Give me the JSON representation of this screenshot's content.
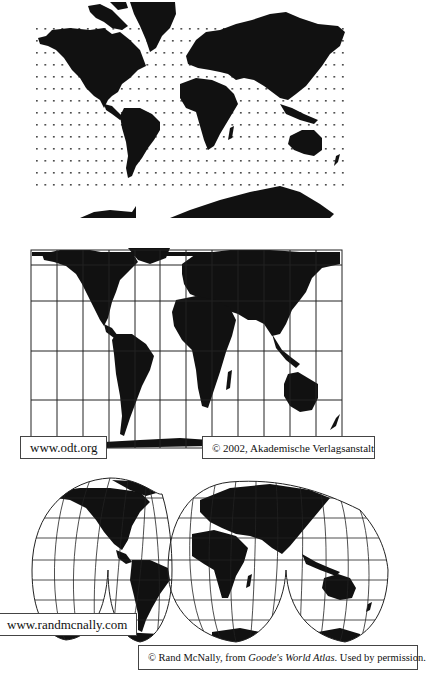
{
  "figure": {
    "maps": [
      {
        "id": "mercator",
        "projection_style": "dotted-grid rectangular world map",
        "labels": []
      },
      {
        "id": "peters",
        "projection_style": "gridded equal-area rectangular world map",
        "labels": {
          "url": "www.odt.org",
          "credit": "© 2002, Akademische Verlagsanstalt"
        }
      },
      {
        "id": "goode",
        "projection_style": "interrupted homolosine world map",
        "labels": {
          "url": "www.randmcnally.com",
          "credit_prefix": "© Rand McNally, from ",
          "credit_title": "Goode's World Atlas",
          "credit_suffix": ". Used by permission."
        }
      }
    ],
    "colors": {
      "land": "#111111",
      "background": "#ffffff",
      "grid": "#222222"
    }
  }
}
